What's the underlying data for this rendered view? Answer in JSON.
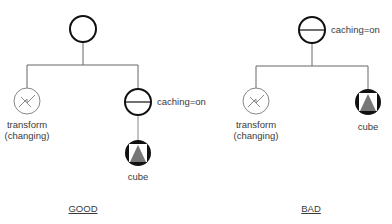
{
  "diagram": {
    "good": {
      "caption": "GOOD",
      "root": {
        "type": "group"
      },
      "children": [
        {
          "type": "transform",
          "label_line1": "transform",
          "label_line2": "(changing)"
        },
        {
          "type": "separator",
          "label": "caching=on",
          "child": {
            "type": "cube",
            "label": "cube"
          }
        }
      ]
    },
    "bad": {
      "caption": "BAD",
      "root": {
        "type": "separator",
        "label": "caching=on"
      },
      "children": [
        {
          "type": "transform",
          "label_line1": "transform",
          "label_line2": "(changing)"
        },
        {
          "type": "cube",
          "label": "cube"
        }
      ]
    }
  },
  "colors": {
    "line": "#555555",
    "node_stroke": "#111111",
    "transform_stroke": "#777777",
    "cube_fill": "#777777"
  }
}
